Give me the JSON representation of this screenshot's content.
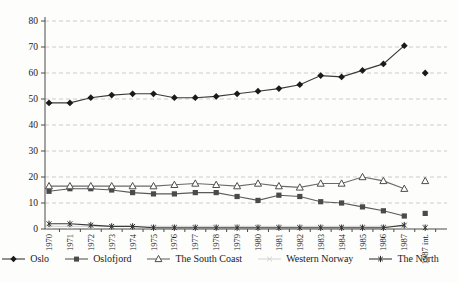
{
  "figure": {
    "background": "#fdfdfc",
    "title": ""
  },
  "chart_data": {
    "type": "line",
    "categories": [
      "1970",
      "1971",
      "1972",
      "1973",
      "1974",
      "1975",
      "1976",
      "1977",
      "1978",
      "1979",
      "1980",
      "1981",
      "1982",
      "1983",
      "1984",
      "1985",
      "1986",
      "1987",
      "1987 int."
    ],
    "last_category_disconnected": true,
    "series": [
      {
        "name": "Oslo",
        "marker": "diamond",
        "color": "#1a1a1a",
        "line_color": "#3a3a3a",
        "values": [
          48.5,
          48.5,
          50.5,
          51.5,
          52,
          52,
          50.5,
          50.5,
          51,
          52,
          53,
          54,
          55.5,
          59,
          58.5,
          61,
          63.5,
          70.5,
          60
        ]
      },
      {
        "name": "Oslofjord",
        "marker": "square",
        "color": "#4a4a4a",
        "line_color": "#5a5a5a",
        "values": [
          14.5,
          15.5,
          15.5,
          15,
          14,
          13.5,
          13.5,
          14,
          14,
          12.5,
          11,
          13,
          12.5,
          10.5,
          10,
          8.5,
          7,
          5,
          6
        ]
      },
      {
        "name": "The South Coast",
        "marker": "triangle",
        "color": "#4d4d4d",
        "line_color": "#6a6a6a",
        "values": [
          16.5,
          16.5,
          16.5,
          16.5,
          16.5,
          16.5,
          17,
          17.5,
          17,
          16.5,
          17.5,
          16.5,
          16,
          17.5,
          17.5,
          20,
          18.5,
          15.5,
          18.5
        ]
      },
      {
        "name": "Western Norway",
        "marker": "x",
        "color": "#d2d2d2",
        "line_color": "#d8d8d8",
        "values": [
          1,
          1,
          1,
          1,
          1,
          1,
          1,
          1,
          1,
          1,
          1,
          1,
          1,
          1,
          1,
          1,
          1,
          1,
          1
        ]
      },
      {
        "name": "The North",
        "marker": "star",
        "color": "#2e2e2e",
        "line_color": "#3a3a3a",
        "values": [
          2,
          2,
          1.5,
          1,
          1,
          0.5,
          0.5,
          0.5,
          0.5,
          0.5,
          0.5,
          0.5,
          0.5,
          0.5,
          0.5,
          0.5,
          0.5,
          1.5,
          0.5
        ]
      }
    ],
    "xlabel": "",
    "ylabel": "",
    "ylim": [
      0,
      80
    ],
    "yticks": [
      0,
      10,
      20,
      30,
      40,
      50,
      60,
      70,
      80
    ],
    "grid": "horizontal-dashed",
    "grid_color": "#c6c6c6",
    "axis_color": "#4a4a4a",
    "tick_label_color": "#1a1a1a",
    "legend_position": "bottom"
  }
}
